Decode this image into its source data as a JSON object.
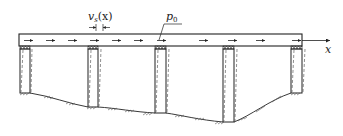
{
  "diagram": {
    "labels": {
      "displacement": "v",
      "displacement_sub": "s",
      "displacement_arg": "(x)",
      "load": "p",
      "load_sub": "0",
      "axis": "x"
    },
    "deck": {
      "x1": 19,
      "x2": 302,
      "y1": 34,
      "y2": 46
    },
    "piers": [
      {
        "x": 19,
        "w": 11,
        "bottom": 93
      },
      {
        "x": 88,
        "w": 10,
        "bottom": 107
      },
      {
        "x": 155,
        "w": 11,
        "bottom": 113
      },
      {
        "x": 222,
        "w": 12,
        "bottom": 122
      },
      {
        "x": 291,
        "w": 11,
        "bottom": 93
      }
    ],
    "colors": {
      "line": "#222222",
      "hatch": "#555555",
      "background": "#ffffff"
    }
  }
}
